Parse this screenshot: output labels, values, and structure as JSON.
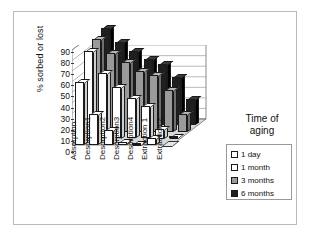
{
  "chart_data": {
    "type": "bar",
    "subtype": "3d-grouped-column",
    "title": "",
    "xlabel": "",
    "ylabel": "% sorbed or lost",
    "ylim": [
      0,
      90
    ],
    "ytick_step": 10,
    "yticks": [
      90,
      80,
      70,
      60,
      50,
      40,
      30,
      20,
      10,
      0
    ],
    "grid": true,
    "legend_position": "right",
    "legend_title": "Time of aging",
    "categories": [
      "Adsorption",
      "Desorption1",
      "Desorption2",
      "Desorption3",
      "Desorption4",
      "Extraction 1",
      "Extraction 2"
    ],
    "series": [
      {
        "name": "1 day",
        "color": "#ffffff",
        "values": [
          60,
          29,
          14,
          3,
          1,
          7,
          0
        ]
      },
      {
        "name": "1 month",
        "color": "#ffffff",
        "values": [
          83,
          62,
          49,
          38,
          31,
          9,
          1
        ]
      },
      {
        "name": "3 months",
        "color": "#9a9a9a",
        "values": [
          88,
          75,
          66,
          58,
          54,
          40,
          17
        ]
      },
      {
        "name": "6 months",
        "color": "#1f1f1f",
        "values": [
          92,
          79,
          71,
          63,
          58,
          46,
          25
        ]
      }
    ]
  },
  "legend": {
    "title_line1": "Time of",
    "title_line2": "aging",
    "items": [
      {
        "label": "1 day",
        "color": "#ffffff"
      },
      {
        "label": "1 month",
        "color": "#ffffff"
      },
      {
        "label": "3 months",
        "color": "#9a9a9a"
      },
      {
        "label": "6 months",
        "color": "#1f1f1f"
      }
    ]
  },
  "axis": {
    "y_title": "% sorbed or lost"
  }
}
